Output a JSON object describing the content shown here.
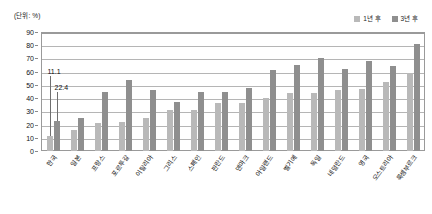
{
  "unit_label": "(단위: %)",
  "legend": {
    "items": [
      {
        "label": "1년 후",
        "color": "#b9b9b9",
        "icon": "square-swatch-icon"
      },
      {
        "label": "3년 후",
        "color": "#8f8f8f",
        "icon": "square-swatch-icon"
      }
    ]
  },
  "annotations": [
    {
      "text": "11.1",
      "series": "1년 후",
      "category": "한국"
    },
    {
      "text": "22.4",
      "series": "3년 후",
      "category": "한국"
    }
  ],
  "chart_data": {
    "type": "bar",
    "title": "",
    "xlabel": "",
    "ylabel": "",
    "ylim": [
      0,
      90
    ],
    "yticks": [
      0,
      10,
      20,
      30,
      40,
      50,
      60,
      70,
      80,
      90
    ],
    "ytick_labels": [
      "0",
      "10",
      "20",
      "30",
      "40",
      "50",
      "60",
      "70",
      "80",
      "90"
    ],
    "grid": true,
    "legend_position": "top-right",
    "unit": "%",
    "categories": [
      "한국",
      "일본",
      "프랑스",
      "포르투갈",
      "이탈리아",
      "그리스",
      "스페인",
      "핀란드",
      "덴마크",
      "아일랜드",
      "벨기에",
      "독일",
      "네덜란드",
      "영국",
      "오스트리아",
      "룩셈부르크"
    ],
    "series": [
      {
        "name": "1년 후",
        "color": "#b9b9b9",
        "values": [
          11.1,
          16.0,
          21.0,
          22.0,
          25.0,
          31.0,
          31.0,
          36.0,
          36.0,
          40.0,
          44.0,
          44.0,
          46.0,
          47.0,
          52.0,
          59.0
        ]
      },
      {
        "name": "3년 후",
        "color": "#8f8f8f",
        "values": [
          22.4,
          25.0,
          45.0,
          54.0,
          46.0,
          37.0,
          45.0,
          45.0,
          48.0,
          61.0,
          65.0,
          70.0,
          62.0,
          68.0,
          64.0,
          81.0
        ]
      }
    ]
  }
}
